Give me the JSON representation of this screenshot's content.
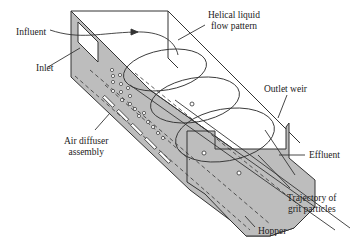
{
  "diagram": {
    "colors": {
      "tank_fill": "#bdbdbd",
      "tank_dark": "#a8a8a8",
      "line": "#333333",
      "background": "#ffffff"
    },
    "labels": {
      "influent": "Influent",
      "inlet": "Inlet",
      "helical_line1": "Helical liquid",
      "helical_line2": "flow pattern",
      "outlet_weir": "Outlet weir",
      "air_line1": "Air diffuser",
      "air_line2": "assembly",
      "effluent": "Effluent",
      "trajectory_line1": "Trajectory of",
      "trajectory_line2": "grit particles",
      "hopper": "Hopper"
    }
  }
}
